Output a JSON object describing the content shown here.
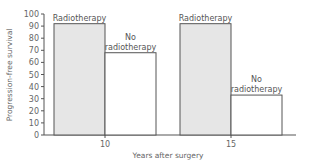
{
  "chart_data": {
    "type": "bar",
    "title": "",
    "xlabel": "Years after surgery",
    "ylabel": "Progression-free survival",
    "ylim": [
      0,
      100
    ],
    "yticks": [
      0,
      10,
      20,
      30,
      40,
      50,
      60,
      70,
      80,
      90,
      100
    ],
    "categories": [
      "10",
      "15"
    ],
    "series": [
      {
        "name": "Radiotherapy",
        "values": [
          92,
          92
        ],
        "color": "#e6e6e6",
        "label_lines": [
          "Radiotherapy"
        ]
      },
      {
        "name": "No radiotherapy",
        "values": [
          68,
          33
        ],
        "color": "#ffffff",
        "label_lines": [
          "No",
          "radiotherapy"
        ]
      }
    ],
    "grid": false,
    "legend": "none (bars labelled directly)"
  },
  "style": {
    "axis_color": "#555555",
    "bar_edge_color": "#555555",
    "radiotherapy_fill": "#e6e6e6",
    "no_radiotherapy_fill": "#ffffff"
  }
}
